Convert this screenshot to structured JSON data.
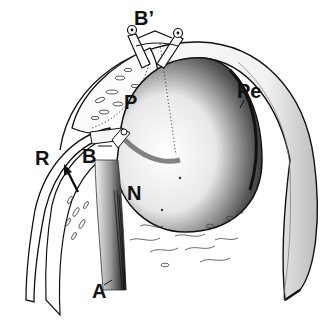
{
  "figure": {
    "type": "anatomical line illustration",
    "colors": {
      "ink": "#111111",
      "background": "#ffffff",
      "shade": "#2a2a2a"
    }
  },
  "labels": [
    {
      "id": "B_prime",
      "text": "B’",
      "x": 134,
      "y": 10,
      "size": 20
    },
    {
      "id": "P",
      "text": "P",
      "x": 125,
      "y": 92,
      "size": 20
    },
    {
      "id": "Pe",
      "text": "Pe",
      "x": 237,
      "y": 82,
      "size": 20
    },
    {
      "id": "R",
      "text": "R",
      "x": 35,
      "y": 148,
      "size": 20
    },
    {
      "id": "B",
      "text": "B",
      "x": 82,
      "y": 146,
      "size": 20
    },
    {
      "id": "N",
      "text": "N",
      "x": 127,
      "y": 183,
      "size": 20
    },
    {
      "id": "A",
      "text": "A",
      "x": 92,
      "y": 282,
      "size": 20
    }
  ]
}
